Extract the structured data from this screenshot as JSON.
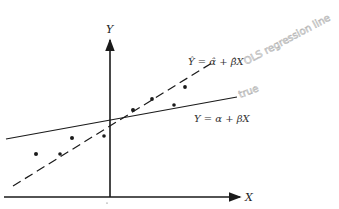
{
  "diagram": {
    "type": "regression-comparison",
    "axes": {
      "x_label": "X",
      "y_label": "Y"
    },
    "lines": {
      "ols": {
        "equation": "Ŷ = α̂ + β̂X",
        "annotation": "OLS regression line",
        "style": "dashed",
        "x1": 13,
        "y1": 186,
        "x2": 215,
        "y2": 61
      },
      "true": {
        "equation": "Y = α + βX",
        "annotation": "true",
        "style": "solid",
        "x1": 6,
        "y1": 139,
        "x2": 237,
        "y2": 97
      }
    },
    "points": [
      {
        "x": 36,
        "y": 154
      },
      {
        "x": 60,
        "y": 154
      },
      {
        "x": 72,
        "y": 138
      },
      {
        "x": 104,
        "y": 136
      },
      {
        "x": 133,
        "y": 110
      },
      {
        "x": 152,
        "y": 99
      },
      {
        "x": 174,
        "y": 105
      },
      {
        "x": 185,
        "y": 87
      }
    ],
    "colors": {
      "ink": "#1a1a1a",
      "handwriting": "#b5b5b5"
    }
  }
}
